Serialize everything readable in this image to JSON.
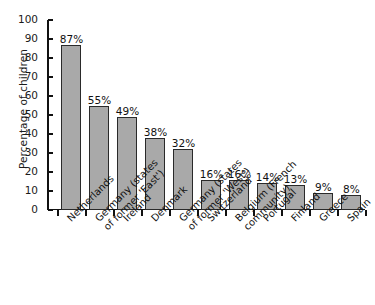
{
  "chart_data": {
    "type": "bar",
    "title": "",
    "xlabel": "",
    "ylabel": "Percentage of children",
    "ylim": [
      0,
      100
    ],
    "ytick_step": 10,
    "yticks": [
      0,
      10,
      20,
      30,
      40,
      50,
      60,
      70,
      80,
      90,
      100
    ],
    "grid": false,
    "legend": null,
    "value_label_suffix": "%",
    "bar_color": "#a9a9a9",
    "bar_edge_color": "#2a2a2a",
    "categories": [
      "Netherlands",
      "Germany (states\nof former 'East')",
      "Ireland",
      "Denmark",
      "Germany (states\nof former 'West')",
      "Switzerland",
      "Belgium (French\ncommunity)",
      "Portugal",
      "Finland",
      "Greece",
      "Spain"
    ],
    "values": [
      87,
      55,
      49,
      38,
      32,
      16,
      16,
      14,
      13,
      9,
      8
    ],
    "value_labels": [
      "87%",
      "55%",
      "49%",
      "38%",
      "32%",
      "16%",
      "16%",
      "14%",
      "13%",
      "9%",
      "8%"
    ]
  }
}
